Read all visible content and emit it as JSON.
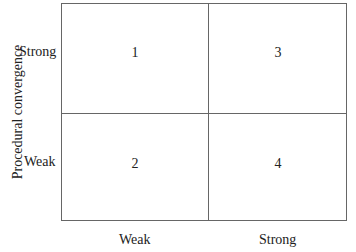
{
  "diagram": {
    "y_axis_title": "Procedural convergence",
    "y_levels": [
      "Strong",
      "Weak"
    ],
    "x_levels": [
      "Weak",
      "Strong"
    ],
    "cells": {
      "top_left": "1",
      "top_right": "3",
      "bottom_left": "2",
      "bottom_right": "4"
    }
  }
}
